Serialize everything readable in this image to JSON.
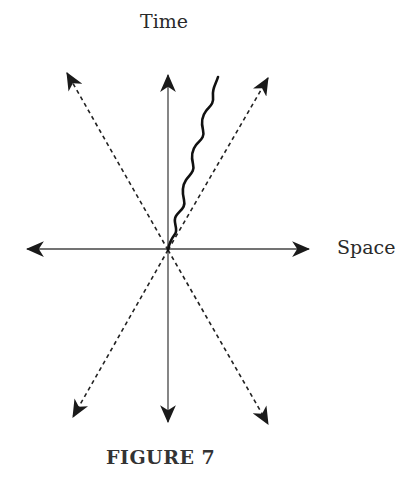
{
  "diagram": {
    "labels": {
      "time": "Time",
      "space": "Space"
    },
    "caption": "FIGURE 7",
    "origin": [
      168,
      250
    ],
    "axes": {
      "time_axis": {
        "up_tip": [
          168,
          75
        ],
        "down_tip": [
          168,
          422
        ],
        "style": "solid"
      },
      "space_axis": {
        "left_tip": [
          27,
          249
        ],
        "right_tip": [
          309,
          249
        ],
        "style": "solid"
      }
    },
    "light_cone": {
      "style": "dashed",
      "rays": [
        {
          "name": "upper-left",
          "tip": [
            67,
            73
          ]
        },
        {
          "name": "upper-right",
          "tip": [
            268,
            78
          ]
        },
        {
          "name": "lower-left",
          "tip": [
            73,
            417
          ]
        },
        {
          "name": "lower-right",
          "tip": [
            268,
            424
          ]
        }
      ]
    },
    "worldline": {
      "style": "wavy",
      "start": [
        168,
        250
      ],
      "end": [
        218,
        77
      ]
    },
    "colors": {
      "ink": "#1a1a1a",
      "background": "#ffffff"
    }
  }
}
